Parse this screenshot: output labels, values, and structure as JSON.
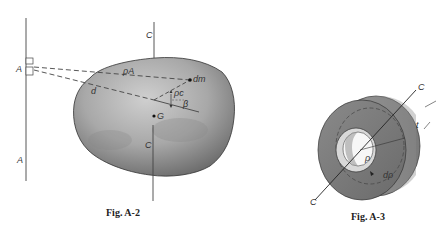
{
  "figures": [
    {
      "caption": "Fig.  A-2",
      "labels": {
        "axis_a_top": "A",
        "axis_a_bottom": "A",
        "axis_c_top": "C",
        "axis_c_bottom": "C",
        "rho_a": "ρA",
        "distance": "d",
        "rho_c": "ρc",
        "beta": "β",
        "mass_element": "dm",
        "centroid": "G"
      }
    },
    {
      "caption": "Fig.  A-3",
      "labels": {
        "axis_c_top": "C",
        "axis_c_bottom": "C",
        "thickness": "t",
        "radius": "ρ",
        "radius_increment": "dρ"
      }
    }
  ],
  "colors": {
    "body_dark": "#6e6e6e",
    "body_light": "#c8c8c8",
    "line": "#333333",
    "dashed": "#555555"
  }
}
